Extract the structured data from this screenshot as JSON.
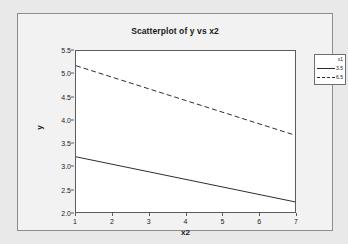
{
  "chart_data": {
    "type": "line",
    "title": "Scatterplot of y vs x2",
    "xlabel": "x2",
    "ylabel": "y",
    "xlim": [
      1,
      7
    ],
    "ylim": [
      2.0,
      5.5
    ],
    "xticks": [
      "1",
      "2",
      "3",
      "4",
      "5",
      "6",
      "7"
    ],
    "yticks": [
      "2.0",
      "2.5",
      "3.0",
      "3.5",
      "4.0",
      "4.5",
      "5.0",
      "5.5"
    ],
    "grid": false,
    "legend_position": "right-outside",
    "legend_title": "x1",
    "x": [
      1,
      7
    ],
    "series": [
      {
        "name": "3.5",
        "style": "solid",
        "color": "#2b2b2b",
        "values": [
          3.2,
          2.22
        ]
      },
      {
        "name": "6.5",
        "style": "dashed",
        "color": "#2b2b2b",
        "values": [
          5.18,
          3.67
        ]
      }
    ]
  }
}
